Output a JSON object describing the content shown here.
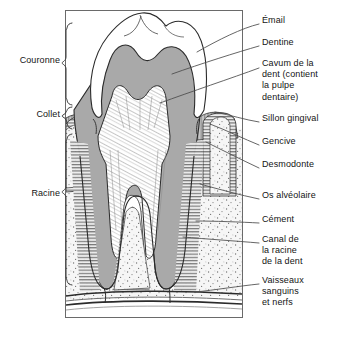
{
  "diagram": {
    "language": "fr",
    "type": "anatomical-cross-section",
    "frame": {
      "x": 65,
      "y": 10,
      "width": 178,
      "height": 308
    },
    "colors": {
      "enamel": "#ffffff",
      "dentine": "#a9a9a9",
      "pulp": "#ffffff",
      "bone": "#f2f2f2",
      "gum": "#bdbdbd",
      "outline": "#2b2b2b",
      "leader_line": "#4a4a4a",
      "text": "#141414",
      "background": "#ffffff"
    }
  },
  "left_labels": [
    {
      "id": "couronne",
      "text": "Couronne",
      "x": 8,
      "y": 59,
      "bracket_top": 22,
      "bracket_bottom": 104
    },
    {
      "id": "collet",
      "text": "Collet",
      "x": 8,
      "y": 113,
      "bracket_top": 106,
      "bracket_bottom": 130
    },
    {
      "id": "racine",
      "text": "Racine",
      "x": 8,
      "y": 192,
      "bracket_top": 133,
      "bracket_bottom": 285
    }
  ],
  "right_labels": [
    {
      "id": "email",
      "lines": [
        "Émail"
      ],
      "x": 262,
      "y": 19
    },
    {
      "id": "dentine",
      "lines": [
        "Dentine"
      ],
      "x": 262,
      "y": 41
    },
    {
      "id": "cavum",
      "lines": [
        "Cavum de la",
        "dent (contient",
        "la pulpe",
        "dentaire)"
      ],
      "x": 262,
      "y": 62
    },
    {
      "id": "sillon-gingival",
      "lines": [
        "Sillon gingival"
      ],
      "x": 262,
      "y": 117
    },
    {
      "id": "gencive",
      "lines": [
        "Gencive"
      ],
      "x": 262,
      "y": 140
    },
    {
      "id": "desmodonte",
      "lines": [
        "Desmodonte"
      ],
      "x": 262,
      "y": 163
    },
    {
      "id": "os-alveolaire",
      "lines": [
        "Os alvéolaire"
      ],
      "x": 262,
      "y": 194
    },
    {
      "id": "cement",
      "lines": [
        "Cément"
      ],
      "x": 262,
      "y": 218
    },
    {
      "id": "canal-racine",
      "lines": [
        "Canal de",
        "la racine",
        "de la dent"
      ],
      "x": 262,
      "y": 238
    },
    {
      "id": "vaisseaux",
      "lines": [
        "Vaisseaux",
        "sanguins",
        "et nerfs"
      ],
      "x": 262,
      "y": 279
    }
  ],
  "leader_lines": [
    {
      "id": "email-leader",
      "from": [
        259,
        24
      ],
      "to": [
        197,
        52
      ]
    },
    {
      "id": "dentine-leader",
      "from": [
        259,
        46
      ],
      "to": [
        172,
        74
      ]
    },
    {
      "id": "cavum-leader",
      "from": [
        259,
        68
      ],
      "to": [
        160,
        103
      ]
    },
    {
      "id": "sillon-gingival-leader",
      "from": [
        259,
        122
      ],
      "to": [
        215,
        112
      ]
    },
    {
      "id": "gencive-leader",
      "from": [
        259,
        145
      ],
      "to": [
        210,
        124
      ]
    },
    {
      "id": "desmodonte-leader",
      "from": [
        259,
        168
      ],
      "to": [
        206,
        142
      ]
    },
    {
      "id": "os-alveolaire-leader",
      "from": [
        259,
        199
      ],
      "to": [
        200,
        184
      ]
    },
    {
      "id": "cement-leader",
      "from": [
        259,
        223
      ],
      "to": [
        196,
        221
      ]
    },
    {
      "id": "canal-leader",
      "from": [
        259,
        243
      ],
      "to": [
        183,
        237
      ]
    },
    {
      "id": "vaisseaux-leader",
      "from": [
        259,
        284
      ],
      "to": [
        196,
        292
      ]
    }
  ]
}
